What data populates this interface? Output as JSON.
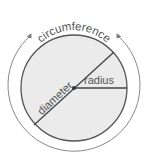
{
  "diagram": {
    "labels": {
      "circumference": "circumference",
      "diameter": "diameter",
      "radius": "radius"
    },
    "colors": {
      "fill": "#e9e9e9",
      "stroke": "#555555",
      "arc": "#777777",
      "text": "#555555"
    }
  }
}
